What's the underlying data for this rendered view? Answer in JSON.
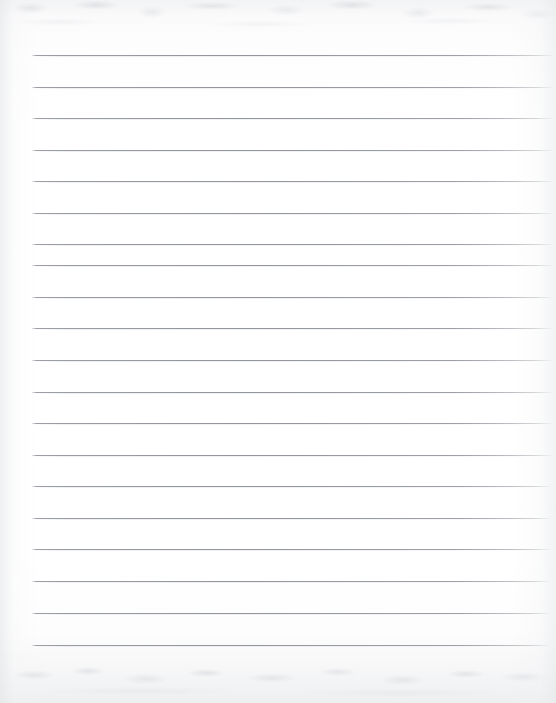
{
  "document": {
    "kind": "scanned-ruled-notebook-page",
    "title": "Blank ruled paper scan",
    "text_content": "",
    "handwriting": "none",
    "page_width": 556,
    "page_height": 703
  },
  "colors": {
    "paper": "#ffffff",
    "paper_edge": "#f1f2f3",
    "rule_line": "#92959c",
    "rule_line_soft": "#dadce0",
    "scan_grain": "#ced1d6"
  },
  "ruling": {
    "style": "wide-ruled horizontal lines",
    "line_count": 20,
    "line_thickness_px": 1,
    "spacing_px": 31.4,
    "left_margin_px": 32,
    "right_end_px": 551,
    "first_line_y": 55,
    "last_line_y": 645,
    "margin_rule": "none",
    "lines": [
      {
        "index": 1,
        "y": 55,
        "x_start": 32,
        "x_end": 552
      },
      {
        "index": 2,
        "y": 87,
        "x_start": 32,
        "x_end": 552
      },
      {
        "index": 3,
        "y": 118,
        "x_start": 32,
        "x_end": 552
      },
      {
        "index": 4,
        "y": 150,
        "x_start": 32,
        "x_end": 552
      },
      {
        "index": 5,
        "y": 181,
        "x_start": 32,
        "x_end": 552
      },
      {
        "index": 6,
        "y": 213,
        "x_start": 32,
        "x_end": 552
      },
      {
        "index": 7,
        "y": 244,
        "x_start": 32,
        "x_end": 552
      },
      {
        "index": 8,
        "y": 265,
        "x_start": 32,
        "x_end": 552
      },
      {
        "index": 9,
        "y": 297,
        "x_start": 32,
        "x_end": 551
      },
      {
        "index": 10,
        "y": 328,
        "x_start": 32,
        "x_end": 551
      },
      {
        "index": 11,
        "y": 360,
        "x_start": 32,
        "x_end": 551
      },
      {
        "index": 12,
        "y": 392,
        "x_start": 32,
        "x_end": 551
      },
      {
        "index": 13,
        "y": 423,
        "x_start": 32,
        "x_end": 551
      },
      {
        "index": 14,
        "y": 455,
        "x_start": 32,
        "x_end": 551
      },
      {
        "index": 15,
        "y": 486,
        "x_start": 32,
        "x_end": 550
      },
      {
        "index": 16,
        "y": 518,
        "x_start": 32,
        "x_end": 550
      },
      {
        "index": 17,
        "y": 549,
        "x_start": 32,
        "x_end": 550
      },
      {
        "index": 18,
        "y": 581,
        "x_start": 32,
        "x_end": 549
      },
      {
        "index": 19,
        "y": 613,
        "x_start": 32,
        "x_end": 549
      },
      {
        "index": 20,
        "y": 645,
        "x_start": 32,
        "x_end": 548
      }
    ]
  },
  "scan_artifacts": {
    "top_band_label": "mottled grain band",
    "top_band_y": 0,
    "top_band_height": 46,
    "bottom_band_label": "mottled grain band",
    "bottom_band_y": 655,
    "bottom_band_height": 48,
    "left_edge_shadow": true,
    "right_edge_shadow": true
  }
}
